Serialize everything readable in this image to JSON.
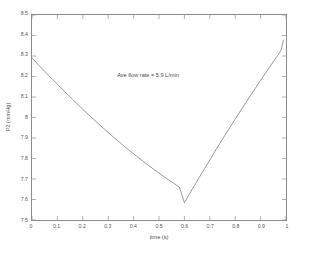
{
  "chart_data": {
    "type": "line",
    "title": "",
    "xlabel": "time (s)",
    "ylabel": "P2 (mmHg)",
    "xlim": [
      0,
      1
    ],
    "ylim": [
      7.5,
      8.5
    ],
    "grid": false,
    "legend": null,
    "xticks": [
      "0",
      "0.1",
      "0.2",
      "0.3",
      "0.4",
      "0.5",
      "0.6",
      "0.7",
      "0.8",
      "0.9",
      "1"
    ],
    "xtick_values": [
      0,
      0.1,
      0.2,
      0.3,
      0.4,
      0.5,
      0.6,
      0.7,
      0.8,
      0.9,
      1
    ],
    "yticks": [
      "7.5",
      "7.6",
      "7.7",
      "7.8",
      "7.9",
      "8",
      "8.1",
      "8.2",
      "8.3",
      "8.4",
      "8.5"
    ],
    "ytick_values": [
      7.5,
      7.6,
      7.7,
      7.8,
      7.9,
      8.0,
      8.1,
      8.2,
      8.3,
      8.4,
      8.5
    ],
    "annotations": [
      {
        "text": "Ave flow rate = 5.9 L/min",
        "x": 0.457,
        "y": 8.205
      }
    ],
    "series": [
      {
        "name": "P2",
        "color": "#6b6b6b",
        "linewidth": 0.7,
        "x": [
          0.0,
          0.02,
          0.04,
          0.06,
          0.08,
          0.1,
          0.12,
          0.14,
          0.16,
          0.18,
          0.2,
          0.22,
          0.24,
          0.26,
          0.28,
          0.3,
          0.32,
          0.34,
          0.36,
          0.38,
          0.4,
          0.42,
          0.44,
          0.46,
          0.48,
          0.5,
          0.52,
          0.54,
          0.56,
          0.58,
          0.6,
          0.62,
          0.64,
          0.66,
          0.68,
          0.7,
          0.72,
          0.74,
          0.76,
          0.78,
          0.8,
          0.82,
          0.84,
          0.86,
          0.88,
          0.9,
          0.92,
          0.94,
          0.96,
          0.98,
          0.99
        ],
        "y": [
          8.29,
          8.264,
          8.238,
          8.212,
          8.187,
          8.162,
          8.137,
          8.112,
          8.088,
          8.064,
          8.04,
          8.017,
          7.994,
          7.971,
          7.949,
          7.927,
          7.905,
          7.884,
          7.863,
          7.843,
          7.823,
          7.803,
          7.784,
          7.765,
          7.747,
          7.729,
          7.711,
          7.694,
          7.677,
          7.661,
          7.585,
          7.627,
          7.669,
          7.711,
          7.752,
          7.793,
          7.834,
          7.874,
          7.914,
          7.953,
          7.992,
          8.031,
          8.069,
          8.107,
          8.144,
          8.181,
          8.218,
          8.254,
          8.29,
          8.326,
          8.378
        ]
      }
    ],
    "key_points": {
      "start": {
        "x": 0,
        "y": 8.29
      },
      "minimum": {
        "x": 0.6,
        "y": 7.585
      },
      "end": {
        "x": 0.99,
        "y": 8.378
      }
    }
  },
  "style": {
    "background": "#ffffff",
    "axis_color": "#8c8c8c",
    "line_color": "#6b6b6b",
    "text_color": "#4a4a4a"
  }
}
